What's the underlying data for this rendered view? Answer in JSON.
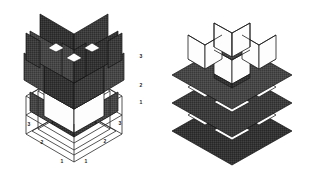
{
  "figure": {
    "background_color": "#ffffff",
    "panel_fill": "#3c3c3c",
    "panel_fill_dark": "#333333",
    "panel_fill_light": "#4a4a4a",
    "edge_color": "#111111",
    "wire_color": "#2a2a2a",
    "white_face": "#fdfdfd",
    "label_color": "#1a1a1a"
  },
  "left_figure": {
    "name": "vertical-panel-lattice",
    "labels": [
      {
        "text": "3",
        "x": 141,
        "y": 58
      },
      {
        "text": "2",
        "x": 141,
        "y": 87
      },
      {
        "text": "1",
        "x": 141,
        "y": 104
      },
      {
        "text": "3",
        "x": 120,
        "y": 125
      },
      {
        "text": "3",
        "x": 29,
        "y": 126
      },
      {
        "text": "2",
        "x": 105,
        "y": 143
      },
      {
        "text": "2",
        "x": 42,
        "y": 144
      },
      {
        "text": "1",
        "x": 86,
        "y": 163
      },
      {
        "text": "1",
        "x": 62,
        "y": 163
      }
    ]
  },
  "right_figure": {
    "name": "horizontal-slab-lattice",
    "labels": []
  }
}
